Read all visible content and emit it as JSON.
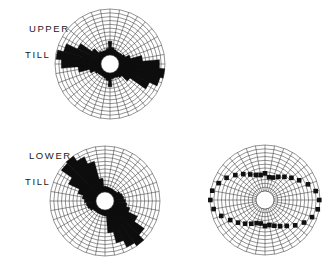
{
  "figure": {
    "type": "rose-diagram-panel",
    "background_color": "#ffffff",
    "line_color": "#3a3a3a",
    "fill_color": "#0d0d0d",
    "marker_color": "#101010"
  },
  "labels": {
    "upper_line1": "UPPER",
    "upper_line2": "TILL",
    "lower_line1": "LOWER",
    "lower_line2": "TILL"
  },
  "chart_data": [
    {
      "type": "rose",
      "id": "upper-till",
      "title": "UPPER TILL",
      "center": [
        110,
        64
      ],
      "radius": 55,
      "hub_radius": 9,
      "rings": 12,
      "sectors": 36,
      "sector_width_deg": 10,
      "grid": true,
      "render": "filled",
      "xlabel": "",
      "ylabel": "",
      "rlim": [
        0,
        12
      ],
      "categories": [
        0,
        10,
        20,
        30,
        40,
        50,
        60,
        70,
        80,
        90,
        100,
        110,
        120,
        130,
        140,
        150,
        160,
        170,
        180,
        190,
        200,
        210,
        220,
        230,
        240,
        250,
        260,
        270,
        280,
        290,
        300,
        310,
        320,
        330,
        340,
        350
      ],
      "values": [
        3.6,
        2.0,
        1.6,
        1.4,
        1.4,
        1.6,
        2.0,
        3.2,
        6.2,
        10.6,
        12.0,
        11.2,
        9.0,
        4.0,
        2.0,
        1.6,
        1.4,
        1.6,
        3.6,
        2.0,
        1.6,
        1.4,
        1.4,
        1.6,
        2.0,
        3.2,
        6.0,
        10.4,
        11.8,
        10.2,
        7.0,
        3.4,
        1.8,
        1.5,
        1.4,
        1.8
      ]
    },
    {
      "type": "rose",
      "id": "lower-till",
      "title": "LOWER TILL",
      "center": [
        105,
        201
      ],
      "radius": 55,
      "hub_radius": 9,
      "rings": 12,
      "sectors": 36,
      "sector_width_deg": 10,
      "grid": true,
      "render": "filled",
      "xlabel": "",
      "ylabel": "",
      "rlim": [
        0,
        12
      ],
      "categories": [
        0,
        10,
        20,
        30,
        40,
        50,
        60,
        70,
        80,
        90,
        100,
        110,
        120,
        130,
        140,
        150,
        160,
        170,
        180,
        190,
        200,
        210,
        220,
        230,
        240,
        250,
        260,
        270,
        280,
        290,
        300,
        310,
        320,
        330,
        340,
        350
      ],
      "values": [
        1.5,
        1.4,
        1.3,
        1.3,
        1.3,
        1.4,
        2.0,
        2.4,
        2.6,
        3.0,
        3.4,
        4.4,
        7.0,
        10.2,
        12.6,
        11.0,
        9.0,
        6.0,
        1.6,
        1.4,
        1.3,
        1.3,
        1.3,
        1.4,
        2.0,
        2.4,
        2.6,
        3.0,
        3.6,
        5.0,
        8.2,
        11.6,
        13.0,
        10.4,
        8.4,
        3.6
      ]
    },
    {
      "type": "rose",
      "id": "unlabeled-dotted",
      "title": "",
      "center": [
        265,
        200
      ],
      "radius": 55,
      "hub_radius": 9,
      "rings": 12,
      "sectors": 36,
      "sector_width_deg": 10,
      "grid": true,
      "render": "markers",
      "marker_size": 2.3,
      "xlabel": "",
      "ylabel": "",
      "rlim": [
        0,
        13
      ],
      "categories": [
        0,
        10,
        20,
        30,
        40,
        50,
        60,
        70,
        80,
        90,
        100,
        110,
        120,
        130,
        140,
        150,
        160,
        170,
        180,
        190,
        200,
        210,
        220,
        230,
        240,
        250,
        260,
        270,
        280,
        290,
        300,
        310,
        320,
        330,
        340,
        350
      ],
      "values": [
        5.0,
        4.0,
        4.2,
        5.0,
        6.0,
        7.2,
        8.6,
        10.4,
        12.0,
        12.8,
        12.6,
        11.6,
        10.2,
        8.6,
        7.0,
        6.0,
        5.2,
        4.6,
        4.8,
        4.2,
        4.4,
        5.2,
        6.2,
        7.4,
        8.8,
        10.6,
        12.2,
        12.9,
        12.6,
        11.4,
        10.0,
        8.4,
        7.0,
        5.8,
        5.0,
        4.6
      ]
    }
  ]
}
